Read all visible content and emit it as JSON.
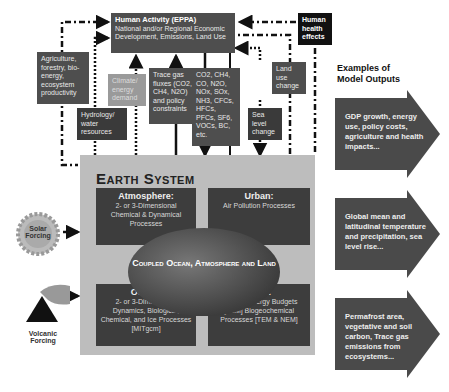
{
  "human_activity": {
    "title": "Human Activity (EPPA)",
    "subtitle": "National and/or Regional Economic Development, Emissions, Land Use"
  },
  "human_health": "Human health effects",
  "left_boxes": [
    {
      "id": "agriculture",
      "text": "Agriculture, forestry, bio-energy, ecosystem productivity"
    },
    {
      "id": "hydrology",
      "text": "Hydrology/ water resources"
    },
    {
      "id": "climate_energy",
      "text": "Climate/ energy demand"
    }
  ],
  "trace_gas": "Trace gas fluxes (CO2, CH4, N2O) and policy constraints",
  "emissions": "CO2, CH4, CO, N2O, NOx, SOx, NH3, CFCs, HFCs, PFCs, SF6, VOCs, BC, etc.",
  "land_use_change": "Land use change",
  "sea_level_change": "Sea level change",
  "earth_system": {
    "title": "Earth System",
    "atmosphere": {
      "heading": "Atmosphere:",
      "text": "2- or 3-Dimensional Chemical & Dynamical Processes"
    },
    "urban": {
      "heading": "Urban:",
      "text": "Air Pollution Processes"
    },
    "ocean": {
      "heading": "Ocean:",
      "text": "2- or 3-Dimensional Dynamics, Biological, Chemical, and Ice Processes [MITgcm]"
    },
    "land": {
      "heading": "Land:",
      "text": "Water & Energy Budgets [CLM] Biogeochemical Processes [TEM & NEM]"
    },
    "core": "Coupled Ocean, Atmosphere and Land"
  },
  "forcings": {
    "solar": "Solar Forcing",
    "volcanic": "Volcanic Forcing"
  },
  "outputs": {
    "heading": "Examples of Model Outputs",
    "items": [
      "GDP growth, energy use, policy costs, agriculture and health impacts...",
      "Global mean and latitudinal temperature and precipitation, sea level rise...",
      "Permafrost area, vegetative and soil carbon, Trace gas emissions from ecosystems..."
    ]
  }
}
